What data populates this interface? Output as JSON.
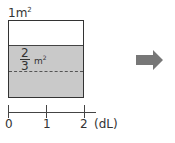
{
  "diagram": {
    "top_label": "1",
    "top_label_unit": "m",
    "top_label_exp": "2",
    "fraction": {
      "numerator": "2",
      "denominator": "3",
      "unit": "m",
      "exp": "2"
    },
    "axis": {
      "ticks": [
        {
          "label": "0",
          "x": 8
        },
        {
          "label": "1",
          "x": 46
        },
        {
          "label": "2",
          "x": 84
        }
      ],
      "unit": "(dL)"
    },
    "colors": {
      "shade": "#c9c9c9",
      "arrow": "#777777",
      "line": "#333333"
    },
    "arrow_icon": "right-arrow-icon"
  }
}
